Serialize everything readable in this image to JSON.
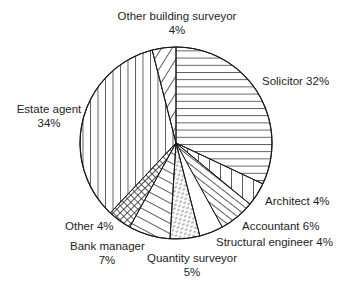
{
  "chart_data": {
    "type": "pie",
    "title": "",
    "start_angle_deg": 0,
    "direction": "clockwise",
    "center": [
      176,
      143
    ],
    "radius": 96,
    "slices": [
      {
        "name": "Solicitor",
        "value": 32,
        "label": "Solicitor 32%",
        "pattern": "horizontal"
      },
      {
        "name": "Architect",
        "value": 4,
        "label": "Architect 4%",
        "pattern": "vertical"
      },
      {
        "name": "Accountant",
        "value": 6,
        "label": "Accountant 6%",
        "pattern": "diag-down"
      },
      {
        "name": "Structural engineer",
        "value": 4,
        "label": "Structural engineer 4%",
        "pattern": "none"
      },
      {
        "name": "Quantity surveyor",
        "value": 5,
        "label": "Quantity surveyor 5%",
        "pattern": "dashes"
      },
      {
        "name": "Bank manager",
        "value": 7,
        "label": "Bank manager 7%",
        "pattern": "diag-shallow"
      },
      {
        "name": "Other",
        "value": 4,
        "label": "Other 4%",
        "pattern": "crosshatch"
      },
      {
        "name": "Estate agent",
        "value": 34,
        "label": "Estate agent 34%",
        "pattern": "vertical-wide"
      },
      {
        "name": "Other building surveyor",
        "value": 4,
        "label": "Other building surveyor 4%",
        "pattern": "diag-up"
      }
    ]
  },
  "labels": {
    "other_building_surveyor": {
      "name": "Other building surveyor",
      "pct": "4%"
    },
    "solicitor": "Solicitor 32%",
    "estate_agent": {
      "name": "Estate agent",
      "pct": "34%"
    },
    "architect": "Architect 4%",
    "accountant": "Accountant 6%",
    "structural_engineer": "Structural engineer 4%",
    "other": "Other 4%",
    "bank_manager": {
      "name": "Bank manager",
      "pct": "7%"
    },
    "quantity_surveyor": {
      "name": "Quantity surveyor",
      "pct": "5%"
    }
  },
  "colors": {
    "stroke": "#1a1a1a",
    "background": "#ffffff"
  }
}
